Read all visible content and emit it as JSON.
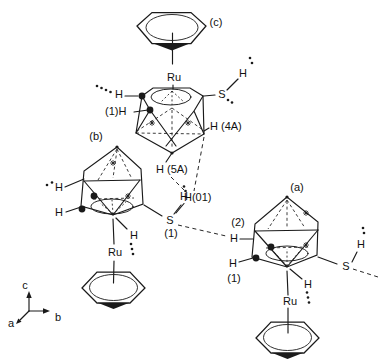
{
  "units": {
    "c": {
      "label": "(c)",
      "ru": "Ru",
      "s": "S",
      "sh_h": "H",
      "h_left": "H",
      "h_c1": "(1)H",
      "h_4a": "H (4A)",
      "h_5a": "H (5A)"
    },
    "b": {
      "label": "(b)",
      "ru": "Ru",
      "s": "S",
      "s_idx": "(1)",
      "sh_h": "H",
      "h_upper": "H",
      "h_lower": "H",
      "h_ru": "H"
    },
    "a": {
      "label": "(a)",
      "ru": "Ru",
      "s": "S",
      "h2_idx": "(2)",
      "h2": "H",
      "h1": "H",
      "h1_idx": "(1)",
      "sh_h": "H",
      "h_ru": "H"
    },
    "bridge": {
      "h01": "H(01)"
    }
  },
  "axes": {
    "a": "a",
    "b": "b",
    "c": "c"
  }
}
